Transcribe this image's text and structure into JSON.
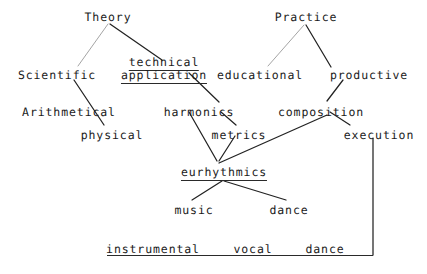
{
  "figure": {
    "kind": "hierarchical-tree-diagram",
    "background_color": "#ffffff",
    "ink_color": "#1a1a1a",
    "width": 427,
    "height": 274
  },
  "nodes": [
    {
      "id": "theory",
      "label": "Theory",
      "x": 108,
      "y": 11,
      "underlined": false
    },
    {
      "id": "practice",
      "label": "Practice",
      "x": 306,
      "y": 11,
      "underlined": false
    },
    {
      "id": "technical",
      "label": "technical",
      "x": 164,
      "y": 56,
      "underlined": true
    },
    {
      "id": "scientific",
      "label": "Scientific",
      "x": 57,
      "y": 69,
      "underlined": false
    },
    {
      "id": "application",
      "label": "application",
      "x": 164,
      "y": 69,
      "underlined": true
    },
    {
      "id": "educational",
      "label": "educational",
      "x": 260,
      "y": 69,
      "underlined": false
    },
    {
      "id": "productive",
      "label": "productive",
      "x": 369,
      "y": 69,
      "underlined": false
    },
    {
      "id": "arithmetical",
      "label": "Arithmetical",
      "x": 69,
      "y": 106,
      "underlined": false
    },
    {
      "id": "harmonics",
      "label": "harmonics",
      "x": 199,
      "y": 106,
      "underlined": false
    },
    {
      "id": "composition",
      "label": "composition",
      "x": 321,
      "y": 106,
      "underlined": false
    },
    {
      "id": "physical",
      "label": "physical",
      "x": 112,
      "y": 129,
      "underlined": false
    },
    {
      "id": "metrics",
      "label": "metrics",
      "x": 239,
      "y": 129,
      "underlined": false
    },
    {
      "id": "execution",
      "label": "execution",
      "x": 379,
      "y": 129,
      "underlined": false
    },
    {
      "id": "eurhythmics",
      "label": "eurhythmics",
      "x": 224,
      "y": 166,
      "underlined": true
    },
    {
      "id": "music",
      "label": "music",
      "x": 194,
      "y": 204,
      "underlined": false
    },
    {
      "id": "dance_mid",
      "label": "dance",
      "x": 289,
      "y": 204,
      "underlined": false
    },
    {
      "id": "instrumental",
      "label": "instrumental",
      "x": 153,
      "y": 243,
      "underlined": false
    },
    {
      "id": "vocal",
      "label": "vocal",
      "x": 253,
      "y": 243,
      "underlined": false
    },
    {
      "id": "dance_bottom",
      "label": "dance",
      "x": 325,
      "y": 243,
      "underlined": false
    }
  ],
  "edges": [
    {
      "id": "theory-scientific",
      "from": "theory",
      "to": "scientific",
      "x1": 108,
      "y1": 24,
      "x2": 78,
      "y2": 66,
      "shade": "light"
    },
    {
      "id": "theory-technical",
      "from": "theory",
      "to": "technical",
      "x1": 110,
      "y1": 24,
      "x2": 162,
      "y2": 60,
      "shade": "dark"
    },
    {
      "id": "practice-educational",
      "from": "practice",
      "to": "educational",
      "x1": 304,
      "y1": 25,
      "x2": 268,
      "y2": 66,
      "shade": "light"
    },
    {
      "id": "practice-productive",
      "from": "practice",
      "to": "productive",
      "x1": 306,
      "y1": 25,
      "x2": 331,
      "y2": 67,
      "shade": "dark"
    },
    {
      "id": "scientific-physical",
      "from": "scientific",
      "to": "physical",
      "x1": 74,
      "y1": 80,
      "x2": 104,
      "y2": 125,
      "shade": "dark"
    },
    {
      "id": "application-harmonics",
      "from": "application",
      "to": "harmonics",
      "x1": 189,
      "y1": 73,
      "x2": 219,
      "y2": 102,
      "shade": "dark"
    },
    {
      "id": "productive-composition",
      "from": "productive",
      "to": "composition",
      "x1": 343,
      "y1": 80,
      "x2": 327,
      "y2": 101,
      "shade": "dark"
    },
    {
      "id": "composition-execution",
      "from": "composition",
      "to": "execution",
      "x1": 330,
      "y1": 112,
      "x2": 350,
      "y2": 125,
      "shade": "dark"
    },
    {
      "id": "harmonics-metrics",
      "from": "harmonics",
      "to": "metrics",
      "x1": 221,
      "y1": 112,
      "x2": 236,
      "y2": 125,
      "shade": "dark"
    },
    {
      "id": "harmonics-eurhythmics",
      "from": "harmonics",
      "to": "eurhythmics",
      "x1": 189,
      "y1": 112,
      "x2": 217,
      "y2": 161,
      "shade": "dark"
    },
    {
      "id": "metrics-eurhythmics",
      "from": "metrics",
      "to": "eurhythmics",
      "x1": 235,
      "y1": 136,
      "x2": 219,
      "y2": 161,
      "shade": "dark"
    },
    {
      "id": "composition-eurhythmics",
      "from": "composition",
      "to": "eurhythmics",
      "x1": 327,
      "y1": 115,
      "x2": 219,
      "y2": 163,
      "shade": "dark"
    },
    {
      "id": "eurhythmics-music",
      "from": "eurhythmics",
      "to": "music",
      "x1": 222,
      "y1": 181,
      "x2": 192,
      "y2": 200,
      "shade": "dark"
    },
    {
      "id": "eurhythmics-dance",
      "from": "eurhythmics",
      "to": "dance_mid",
      "x1": 224,
      "y1": 181,
      "x2": 286,
      "y2": 200,
      "shade": "dark"
    },
    {
      "id": "execution-down",
      "from": "execution",
      "to": "baseline",
      "x1": 373,
      "y1": 138,
      "x2": 373,
      "y2": 255,
      "shade": "dark"
    }
  ],
  "baseline_rule": {
    "id": "bottom-rule",
    "x": 107,
    "y": 255,
    "width": 266
  },
  "relations": [
    "Theory → Scientific, technical application",
    "Theory/Scientific → Arithmetical, physical",
    "technical application → harmonics → metrics",
    "Practice → educational, productive",
    "productive → composition → execution",
    "harmonics + metrics + composition → eurhythmics",
    "eurhythmics → music, dance",
    "execution → instrumental, vocal, dance"
  ]
}
